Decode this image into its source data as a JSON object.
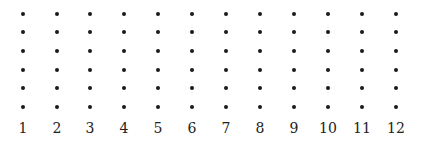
{
  "diagram": {
    "type": "dot-grid",
    "rows": 6,
    "columns": 12,
    "column_labels": [
      "1",
      "2",
      "3",
      "4",
      "5",
      "6",
      "7",
      "8",
      "9",
      "10",
      "11",
      "12"
    ],
    "column_x": [
      23,
      57,
      90,
      124,
      158,
      192,
      226,
      260,
      294,
      328,
      362,
      396
    ],
    "row_y": [
      14,
      32,
      51,
      70,
      88,
      107
    ],
    "dot_color": "#1a1a1a"
  }
}
